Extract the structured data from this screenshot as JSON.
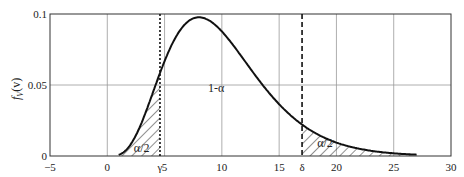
{
  "chart_data": {
    "type": "line",
    "title": "",
    "xlabel": "",
    "ylabel": "f_V(v)",
    "xlim": [
      -5,
      30
    ],
    "ylim": [
      0,
      0.1
    ],
    "grid": true,
    "x_ticks": [
      -5,
      0,
      5,
      10,
      15,
      20,
      25,
      30
    ],
    "x_tick_labels": [
      "−5",
      "0",
      "5",
      "10",
      "15",
      "20",
      "25",
      "30"
    ],
    "y_ticks": [
      0,
      0.05,
      0.1
    ],
    "y_tick_labels": [
      "0",
      "0.05",
      "0.1"
    ],
    "series": [
      {
        "name": "chi-square pdf (10 dof)",
        "dof": 10,
        "x": [
          1,
          2,
          3,
          4,
          5,
          6,
          7,
          8,
          9,
          10,
          11,
          12,
          13,
          14,
          15,
          16,
          17,
          18,
          19,
          20,
          21,
          22,
          23,
          24,
          25,
          26,
          27
        ],
        "values": [
          0.0008,
          0.0077,
          0.0235,
          0.0451,
          0.0668,
          0.084,
          0.0944,
          0.0977,
          0.0947,
          0.0877,
          0.0778,
          0.0669,
          0.0559,
          0.0455,
          0.0363,
          0.0284,
          0.0219,
          0.0167,
          0.0126,
          0.0095,
          0.007,
          0.0052,
          0.0038,
          0.0028,
          0.002,
          0.0014,
          0.001
        ]
      }
    ],
    "vlines": [
      {
        "label": "γ",
        "x": 4.6,
        "style": "dotted"
      },
      {
        "label": "δ",
        "x": 17.0,
        "style": "dashed"
      }
    ],
    "shaded_regions": [
      {
        "from": 1,
        "to": 4.6,
        "pattern": "hatch",
        "label": "α/2"
      },
      {
        "from": 17.0,
        "to": 27,
        "pattern": "hatch",
        "label": "α/2"
      }
    ],
    "annotations": [
      {
        "text": "1-α",
        "x": 9.5,
        "y": 0.045
      },
      {
        "text": "α/2",
        "x": 3.2,
        "y": 0.004
      },
      {
        "text": "α/2",
        "x": 19.0,
        "y": 0.01
      }
    ]
  },
  "labels": {
    "ylabel": "f",
    "ylabel_sub": "V",
    "ylabel_arg": "(v)",
    "gamma": "γ",
    "delta": "δ",
    "one_minus_alpha": "1-α",
    "alpha_half_left": "α/2",
    "alpha_half_right": "α/2"
  }
}
